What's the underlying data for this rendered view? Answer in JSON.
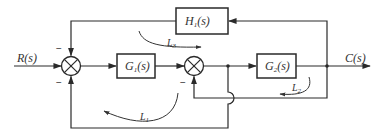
{
  "diagram": {
    "input_signal": "R(s)",
    "output_signal": "C(s)",
    "blocks": [
      {
        "id": "G1",
        "base": "G",
        "sub": "1",
        "arg": "(s)"
      },
      {
        "id": "G2",
        "base": "G",
        "sub": "2",
        "arg": "(s)"
      },
      {
        "id": "H1",
        "base": "H",
        "sub": "1",
        "arg": "(s)"
      }
    ],
    "summing_junctions": [
      {
        "id": "sum1",
        "signs": {
          "top": "−",
          "bottom": "−"
        }
      },
      {
        "id": "sum2",
        "signs": {
          "bottom": "−"
        }
      }
    ],
    "loops": [
      {
        "id": "L1",
        "base": "L",
        "sub": "1"
      },
      {
        "id": "L2",
        "base": "L",
        "sub": "2"
      },
      {
        "id": "L3",
        "base": "L",
        "sub": "3"
      }
    ]
  }
}
